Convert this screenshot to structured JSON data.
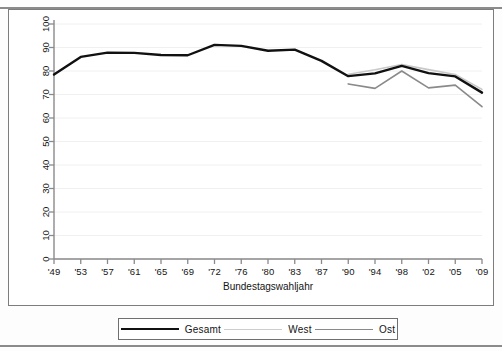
{
  "chart_data": {
    "type": "line",
    "title": "",
    "xlabel": "Bundestagswahljahr",
    "ylabel": "",
    "categories": [
      "'49",
      "'53",
      "'57",
      "'61",
      "'65",
      "'69",
      "'72",
      "'76",
      "'80",
      "'83",
      "'87",
      "'90",
      "'94",
      "'98",
      "'02",
      "'05",
      "'09"
    ],
    "ylim": [
      0,
      100
    ],
    "yticks": [
      0,
      10,
      20,
      30,
      40,
      50,
      60,
      70,
      80,
      90,
      100
    ],
    "grid": true,
    "legend_position": "bottom",
    "series": [
      {
        "name": "Gesamt",
        "color": "#111111",
        "width": 2.4,
        "values": [
          78.5,
          86.0,
          87.8,
          87.7,
          86.8,
          86.7,
          91.1,
          90.7,
          88.6,
          89.1,
          84.3,
          77.8,
          79.0,
          82.2,
          79.1,
          77.7,
          70.8
        ]
      },
      {
        "name": "West",
        "color": "#c8c8c8",
        "width": 1.6,
        "values": [
          null,
          null,
          null,
          null,
          null,
          null,
          null,
          null,
          null,
          null,
          null,
          78.6,
          80.5,
          82.8,
          80.6,
          78.5,
          72.2
        ]
      },
      {
        "name": "Ost",
        "color": "#8a8a8a",
        "width": 1.6,
        "values": [
          null,
          null,
          null,
          null,
          null,
          null,
          null,
          null,
          null,
          null,
          null,
          74.5,
          72.6,
          80.0,
          72.8,
          74.0,
          64.8
        ]
      }
    ]
  },
  "legend": {
    "items": [
      {
        "label": "Gesamt",
        "color": "#111111",
        "width": 2.6
      },
      {
        "label": "West",
        "color": "#cdcdcd",
        "width": 1.5
      },
      {
        "label": "Ost",
        "color": "#8a8a8a",
        "width": 1.5
      }
    ]
  }
}
